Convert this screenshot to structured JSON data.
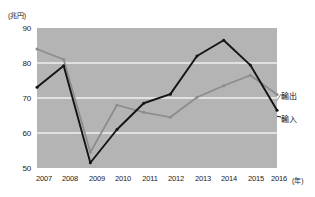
{
  "chart_data": {
    "type": "line",
    "title": "",
    "xlabel": "(年)",
    "ylabel": "(兆円)",
    "unit_label": "(兆円)",
    "x_unit_label": "(年)",
    "categories": [
      "2007",
      "2008",
      "2009",
      "2010",
      "2011",
      "2012",
      "2013",
      "2014",
      "2015",
      "2016"
    ],
    "ylim": [
      50,
      90
    ],
    "yticks": [
      "90",
      "80",
      "70",
      "60",
      "50"
    ],
    "ytick_values": [
      90,
      80,
      70,
      60,
      50
    ],
    "grid": true,
    "legend_position": "right-inline",
    "series": [
      {
        "name": "輸出",
        "color": "#8c8c8c",
        "values": [
          84.0,
          81.0,
          54.5,
          68.0,
          65.9,
          64.5,
          70.2,
          73.5,
          76.5,
          71.0
        ]
      },
      {
        "name": "輸入",
        "color": "#141414",
        "values": [
          73.1,
          79.2,
          51.5,
          61.0,
          68.5,
          71.1,
          82.0,
          86.5,
          79.4,
          66.5
        ]
      }
    ],
    "annotations": [
      {
        "text": "輸出",
        "series": "輸出"
      },
      {
        "text": "輸入",
        "series": "輸入"
      }
    ],
    "colors": {
      "plot_background": "#b4b4b4",
      "gridline": "#f0f0f0",
      "page_background": "#ffffff",
      "text": "#1a1a1a"
    }
  }
}
